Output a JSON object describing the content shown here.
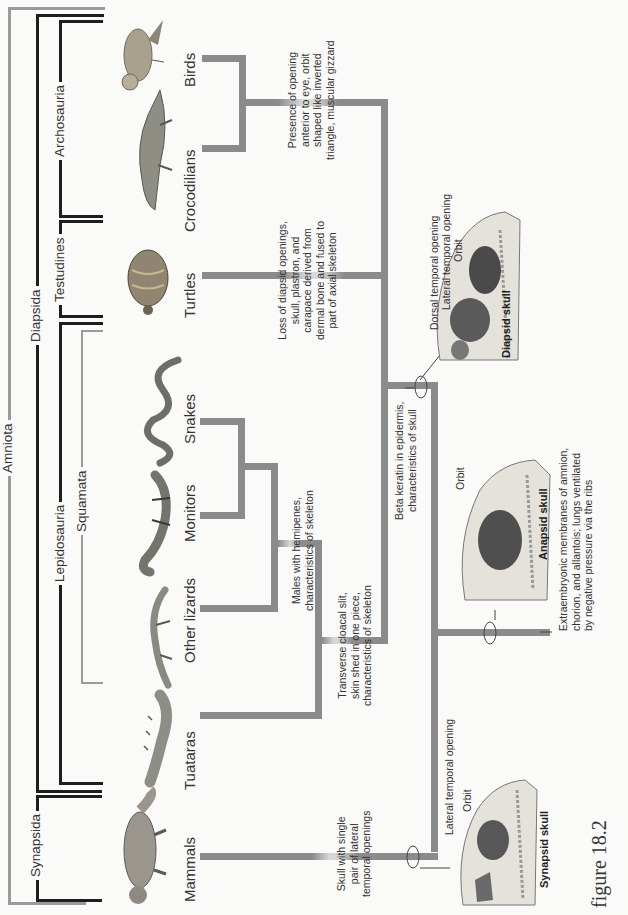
{
  "figure": {
    "label": "figure 18.2"
  },
  "clades": {
    "amniota": "Amniota",
    "synapsida": "Synapsida",
    "diapsida": "Diapsida",
    "lepidosauria": "Lepidosauria",
    "squamata": "Squamata",
    "testudines": "Testudines",
    "archosauria": "Archosauria"
  },
  "taxa": [
    {
      "name": "Birds"
    },
    {
      "name": "Crocodilians"
    },
    {
      "name": "Turtles"
    },
    {
      "name": "Snakes"
    },
    {
      "name": "Monitors"
    },
    {
      "name": "Other lizards"
    },
    {
      "name": "Tuataras"
    },
    {
      "name": "Mammals"
    }
  ],
  "characters": {
    "archosaur": [
      "Presence of opening",
      "anterior to eye, orbit",
      "shaped like inverted",
      "triangle, muscular gizzard"
    ],
    "turtle": [
      "Loss of diapsid openings,",
      "skull, plastron, and",
      "carapace derived from",
      "dermal bone and fused to",
      "part of axial skeleton"
    ],
    "squamate_inner": [
      "Males with hemipenes,",
      "characteristics of skeleton"
    ],
    "lepidosaur": [
      "Transverse cloacal slit,",
      "skin shed in one piece,",
      "characteristics of skeleton"
    ],
    "reptile": [
      "Beta keratin in epidermis,",
      "characteristics of skull"
    ],
    "synapsid": [
      "Skull with single",
      "pair of lateral",
      "temporal openings"
    ],
    "amniote": [
      "Extraembryonic membranes of amnion,",
      "chorion, and allantois; lungs ventilated",
      "by negative pressure via the ribs"
    ]
  },
  "skulls": {
    "diapsid": {
      "title": "Diapsid skull",
      "labels": [
        "Dorsal temporal opening",
        "Lateral temporal opening",
        "Orbit"
      ]
    },
    "anapsid": {
      "title": "Anapsid skull",
      "labels": [
        "Orbit"
      ]
    },
    "synapsid": {
      "title": "Synapsid skull",
      "labels": [
        "Lateral temporal opening",
        "Orbit"
      ]
    }
  }
}
